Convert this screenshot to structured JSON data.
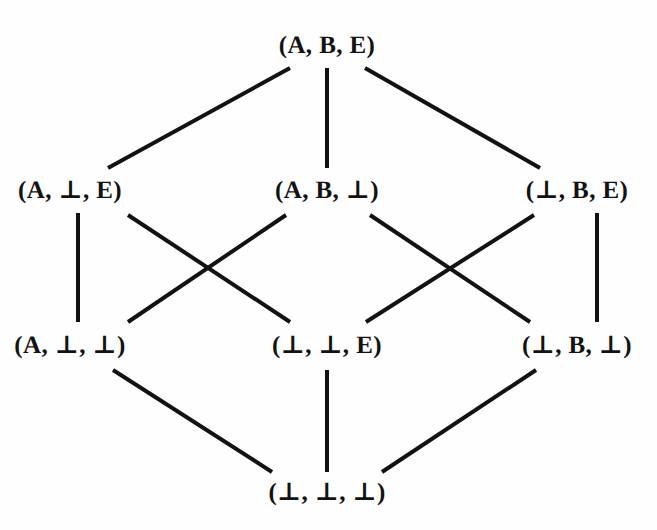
{
  "figure": {
    "kind": "hasse-diagram",
    "title": "",
    "background_color": "#fefefe",
    "edge_color": "#121212",
    "label_color": "#121212",
    "edge_width": 4,
    "width": 657,
    "height": 530
  },
  "nodes": [
    {
      "id": "abe",
      "label": "(A, B, E)",
      "x": 327,
      "y": 45,
      "level": 0
    },
    {
      "id": "a_e",
      "label": "(A, ⊥, E)",
      "x": 70,
      "y": 190,
      "level": 1
    },
    {
      "id": "ab_",
      "label": "(A, B, ⊥)",
      "x": 327,
      "y": 190,
      "level": 1
    },
    {
      "id": "_be",
      "label": "(⊥, B, E)",
      "x": 577,
      "y": 190,
      "level": 1
    },
    {
      "id": "a__",
      "label": "(A, ⊥, ⊥)",
      "x": 70,
      "y": 345,
      "level": 2
    },
    {
      "id": "__e",
      "label": "(⊥, ⊥, E)",
      "x": 327,
      "y": 345,
      "level": 2
    },
    {
      "id": "_b_",
      "label": "(⊥, B, ⊥)",
      "x": 577,
      "y": 345,
      "level": 2
    },
    {
      "id": "___",
      "label": "(⊥, ⊥, ⊥)",
      "x": 327,
      "y": 492,
      "level": 3
    }
  ],
  "edges": [
    {
      "from": "abe",
      "to": "a_e",
      "x1": 290,
      "y1": 68,
      "x2": 108,
      "y2": 168
    },
    {
      "from": "abe",
      "to": "ab_",
      "x1": 327,
      "y1": 68,
      "x2": 327,
      "y2": 168
    },
    {
      "from": "abe",
      "to": "_be",
      "x1": 365,
      "y1": 68,
      "x2": 540,
      "y2": 168
    },
    {
      "from": "a_e",
      "to": "a__",
      "x1": 78,
      "y1": 213,
      "x2": 78,
      "y2": 322
    },
    {
      "from": "a_e",
      "to": "__e",
      "x1": 128,
      "y1": 215,
      "x2": 290,
      "y2": 322
    },
    {
      "from": "ab_",
      "to": "a__",
      "x1": 286,
      "y1": 215,
      "x2": 128,
      "y2": 322
    },
    {
      "from": "ab_",
      "to": "__e",
      "x1": 370,
      "y1": 215,
      "x2": 530,
      "y2": 322
    },
    {
      "from": "_be",
      "to": "__e",
      "x1": 534,
      "y1": 215,
      "x2": 366,
      "y2": 322
    },
    {
      "from": "_be",
      "to": "_b_",
      "x1": 597,
      "y1": 213,
      "x2": 597,
      "y2": 322
    },
    {
      "from": "a__",
      "to": "___",
      "x1": 113,
      "y1": 370,
      "x2": 272,
      "y2": 472
    },
    {
      "from": "__e",
      "to": "___",
      "x1": 327,
      "y1": 370,
      "x2": 327,
      "y2": 472
    },
    {
      "from": "_b_",
      "to": "___",
      "x1": 536,
      "y1": 370,
      "x2": 382,
      "y2": 472
    }
  ]
}
